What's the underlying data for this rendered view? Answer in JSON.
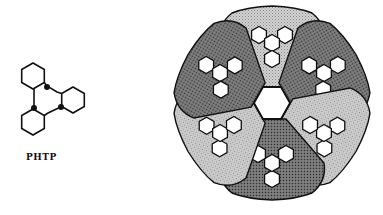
{
  "molecule": {
    "name": "PHTP",
    "rings": 4,
    "marked_atoms": 3
  },
  "crystal": {
    "central_channel": "hexagon",
    "sectors": 6,
    "sector_shading": [
      "light-stipple",
      "dark-stipple",
      "light-stipple",
      "dark-stipple",
      "light-stipple",
      "dark-stipple"
    ],
    "guest_molecules_per_sector": 1,
    "colors": {
      "light": "#c8c8c8",
      "dark": "#6e6e6e",
      "outline": "#111111",
      "hex_fill": "#ffffff"
    }
  }
}
